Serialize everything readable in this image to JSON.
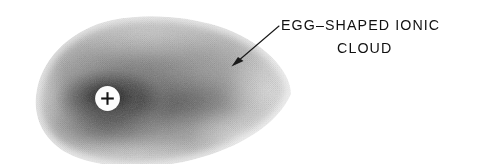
{
  "figure": {
    "kind": "scanned-halftone-diagram",
    "background_color": "#ffffff",
    "width": 479,
    "height": 164
  },
  "annotation": {
    "line1": "EGG–SHAPED IONIC",
    "line2": "CLOUD",
    "text_color": "#111111",
    "leader_line": {
      "from_x": 279,
      "from_y": 26,
      "to_x": 232,
      "to_y": 66,
      "color": "#1a1a1a",
      "stroke_width": 1.1
    }
  },
  "cloud": {
    "label": "egg-shaped ionic cloud",
    "left_x": 36,
    "right_x": 291,
    "top_y": 15,
    "bottom_y": 159,
    "center_x": 150,
    "center_y": 92,
    "edge_gray": "#d2d2d2",
    "mid_gray": "#9a9a9a",
    "core_gray": "#3a3a3a",
    "darkest_gray": "#1f1f1f"
  },
  "ion_marker": {
    "label": "positive ion",
    "symbol": "+",
    "center_x": 107.5,
    "center_y": 98.5,
    "radius": 12.4,
    "disc_color": "#fcfcfc",
    "symbol_color": "#141414"
  }
}
